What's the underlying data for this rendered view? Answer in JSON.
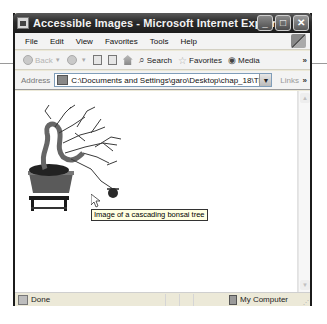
{
  "window": {
    "title": "Accessible Images - Microsoft Internet Explorer",
    "buttons": {
      "minimize": "_",
      "maximize": "□",
      "close": "✕"
    }
  },
  "menubar": {
    "items": [
      "File",
      "Edit",
      "View",
      "Favorites",
      "Tools",
      "Help"
    ]
  },
  "toolbar": {
    "back_label": "Back",
    "search_label": "Search",
    "favorites_label": "Favorites",
    "media_label": "Media",
    "overflow": "»"
  },
  "addressbar": {
    "label": "Address",
    "value": "C:\\Documents and Settings\\garo\\Desktop\\chap_18\\TMPw0:",
    "links_label": "Links",
    "overflow": "»"
  },
  "content": {
    "image_alt": "Image of a cascading bonsai tree",
    "tooltip": "Image of a cascading bonsai tree"
  },
  "statusbar": {
    "status": "Done",
    "zone": "My Computer"
  }
}
